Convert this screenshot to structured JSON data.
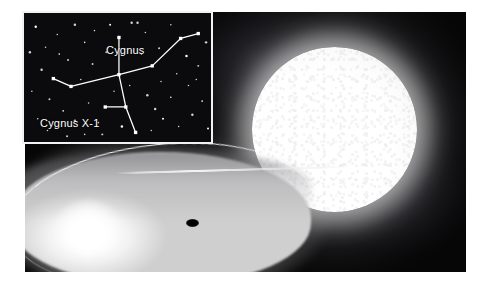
{
  "figure": {
    "background_color": "#ffffff"
  },
  "main_illustration": {
    "name": "cygnus-x1-artist-impression",
    "background_color": "#060607",
    "components": {
      "companion_star": {
        "name": "blue-supergiant-companion-star",
        "color": "#ffffff"
      },
      "accretion_disk": {
        "name": "accretion-disk",
        "color": "#f2f2f2"
      },
      "black_hole": {
        "name": "black-hole",
        "color": "#000000"
      },
      "accretion_stream": {
        "name": "accretion-stream",
        "color": "#ffffff"
      },
      "hotspot": {
        "name": "disk-impact-hotspot",
        "color": "#ffffff"
      }
    }
  },
  "inset_chart": {
    "name": "cygnus-constellation-star-chart",
    "background_color": "#0b0b0d",
    "border_color": "#f2f2f2",
    "star_color": "#ffffff",
    "line_color": "#ffffff",
    "labels": {
      "constellation": "Cygnus",
      "source": "Cygnus X-1"
    },
    "constellation_lines": [
      {
        "from": [
          97,
          63
        ],
        "to": [
          48,
          75
        ]
      },
      {
        "from": [
          48,
          75
        ],
        "to": [
          30,
          67
        ]
      },
      {
        "from": [
          97,
          63
        ],
        "to": [
          97,
          25
        ]
      },
      {
        "from": [
          97,
          63
        ],
        "to": [
          131,
          54
        ]
      },
      {
        "from": [
          131,
          54
        ],
        "to": [
          160,
          26
        ]
      },
      {
        "from": [
          160,
          26
        ],
        "to": [
          178,
          21
        ]
      },
      {
        "from": [
          97,
          63
        ],
        "to": [
          104,
          96
        ]
      },
      {
        "from": [
          104,
          96
        ],
        "to": [
          114,
          122
        ]
      },
      {
        "from": [
          83,
          96
        ],
        "to": [
          104,
          96
        ]
      }
    ],
    "marked_stars": [
      [
        97,
        25
      ],
      [
        97,
        63
      ],
      [
        48,
        75
      ],
      [
        30,
        67
      ],
      [
        131,
        54
      ],
      [
        160,
        26
      ],
      [
        178,
        21
      ],
      [
        104,
        96
      ],
      [
        114,
        122
      ],
      [
        83,
        96
      ]
    ],
    "field_stars": [
      [
        12,
        14
      ],
      [
        22,
        35
      ],
      [
        34,
        22
      ],
      [
        45,
        48
      ],
      [
        52,
        12
      ],
      [
        62,
        30
      ],
      [
        70,
        52
      ],
      [
        58,
        68
      ],
      [
        18,
        58
      ],
      [
        26,
        88
      ],
      [
        40,
        100
      ],
      [
        14,
        108
      ],
      [
        52,
        110
      ],
      [
        66,
        92
      ],
      [
        76,
        112
      ],
      [
        88,
        12
      ],
      [
        110,
        10
      ],
      [
        124,
        20
      ],
      [
        138,
        36
      ],
      [
        150,
        12
      ],
      [
        166,
        44
      ],
      [
        178,
        54
      ],
      [
        156,
        62
      ],
      [
        140,
        70
      ],
      [
        126,
        84
      ],
      [
        150,
        86
      ],
      [
        168,
        74
      ],
      [
        182,
        90
      ],
      [
        172,
        104
      ],
      [
        158,
        116
      ],
      [
        142,
        108
      ],
      [
        130,
        120
      ],
      [
        116,
        10
      ],
      [
        84,
        40
      ],
      [
        72,
        18
      ],
      [
        36,
        42
      ],
      [
        6,
        40
      ],
      [
        8,
        80
      ],
      [
        92,
        80
      ],
      [
        80,
        124
      ],
      [
        100,
        116
      ],
      [
        62,
        124
      ],
      [
        44,
        126
      ],
      [
        24,
        120
      ],
      [
        186,
        30
      ],
      [
        188,
        118
      ],
      [
        120,
        42
      ],
      [
        108,
        74
      ],
      [
        134,
        98
      ],
      [
        176,
        68
      ]
    ]
  }
}
